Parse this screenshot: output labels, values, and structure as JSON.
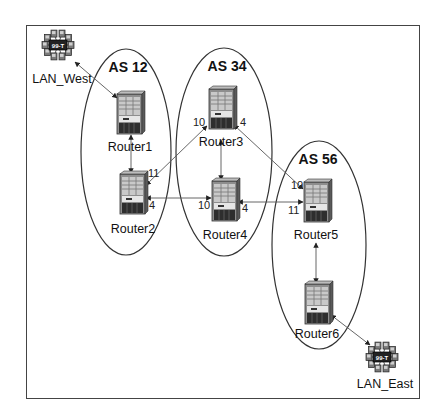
{
  "diagram": {
    "title": "",
    "colors": {
      "frame": "#444444",
      "line": "#555555",
      "ellipse": "#333333",
      "router_body": "#9a9a9a",
      "router_dark": "#3a3a3a",
      "lan_hub": "#222222"
    },
    "autonomous_systems": [
      {
        "id": "as12",
        "label": "AS 12",
        "cx": 126,
        "cy": 152,
        "rx": 45,
        "ry": 103,
        "label_x": 128,
        "label_y": 60
      },
      {
        "id": "as34",
        "label": "AS 34",
        "cx": 224,
        "cy": 152,
        "rx": 48,
        "ry": 104,
        "label_x": 227,
        "label_y": 59
      },
      {
        "id": "as56",
        "label": "AS 56",
        "cx": 319,
        "cy": 245,
        "rx": 47,
        "ry": 104,
        "label_x": 318,
        "label_y": 152
      }
    ],
    "routers": [
      {
        "id": "router1",
        "label": "Router1",
        "x": 117,
        "y": 94,
        "label_x": 130,
        "label_y": 141
      },
      {
        "id": "router2",
        "label": "Router2",
        "x": 120,
        "y": 174,
        "label_x": 133,
        "label_y": 223
      },
      {
        "id": "router3",
        "label": "Router3",
        "x": 209,
        "y": 89,
        "label_x": 221,
        "label_y": 136
      },
      {
        "id": "router4",
        "label": "Router4",
        "x": 212,
        "y": 181,
        "label_x": 225,
        "label_y": 229
      },
      {
        "id": "router5",
        "label": "Router5",
        "x": 304,
        "y": 182,
        "label_x": 316,
        "label_y": 229
      },
      {
        "id": "router6",
        "label": "Router6",
        "x": 305,
        "y": 284,
        "label_x": 317,
        "label_y": 328
      }
    ],
    "lans": [
      {
        "id": "lan_west",
        "label": "LAN_West",
        "x": 58,
        "y": 45,
        "label_x": 62,
        "label_y": 73,
        "hub_text": "99-T"
      },
      {
        "id": "lan_east",
        "label": "LAN_East",
        "x": 382,
        "y": 357,
        "label_x": 385,
        "label_y": 378,
        "hub_text": "99-T"
      }
    ],
    "links": [
      {
        "from": "lan_west",
        "to": "router1",
        "x1": 75,
        "y1": 62,
        "x2": 117,
        "y2": 98
      },
      {
        "from": "router1",
        "to": "router2",
        "x1": 131,
        "y1": 135,
        "x2": 131,
        "y2": 173
      },
      {
        "from": "router3",
        "to": "router2",
        "x1": 207,
        "y1": 126,
        "x2": 146,
        "y2": 185
      },
      {
        "from": "router3",
        "to": "router4",
        "x1": 221,
        "y1": 140,
        "x2": 221,
        "y2": 180
      },
      {
        "from": "router3",
        "to": "router5",
        "x1": 234,
        "y1": 125,
        "x2": 303,
        "y2": 189
      },
      {
        "from": "router2",
        "to": "router4",
        "x1": 146,
        "y1": 198,
        "x2": 211,
        "y2": 198
      },
      {
        "from": "router4",
        "to": "router5",
        "x1": 238,
        "y1": 202,
        "x2": 303,
        "y2": 202
      },
      {
        "from": "router5",
        "to": "router6",
        "x1": 316,
        "y1": 243,
        "x2": 316,
        "y2": 283
      },
      {
        "from": "router6",
        "to": "lan_east",
        "x1": 331,
        "y1": 315,
        "x2": 370,
        "y2": 345
      }
    ],
    "port_labels": [
      {
        "text": "11",
        "x": 148,
        "y": 168
      },
      {
        "text": "4",
        "x": 149,
        "y": 200
      },
      {
        "text": "10",
        "x": 193,
        "y": 117
      },
      {
        "text": "4",
        "x": 240,
        "y": 117
      },
      {
        "text": "10",
        "x": 198,
        "y": 200
      },
      {
        "text": "4",
        "x": 242,
        "y": 203
      },
      {
        "text": "10",
        "x": 291,
        "y": 180
      },
      {
        "text": "11",
        "x": 288,
        "y": 205
      }
    ]
  }
}
